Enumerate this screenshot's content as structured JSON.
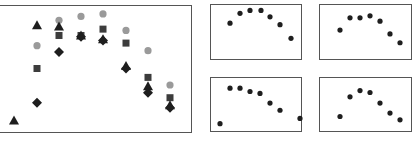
{
  "chart_data": [
    {
      "type": "scatter",
      "title": "",
      "xlabel": "",
      "ylabel": "",
      "grid": false,
      "legend": "none",
      "ylim": [
        0,
        100
      ],
      "x": [
        1,
        2,
        3,
        4,
        5,
        6,
        7,
        8
      ],
      "series": [
        {
          "name": "circle",
          "marker": "circle",
          "color": "#9a9a9a",
          "x": [
            2,
            3,
            4,
            5,
            6,
            7,
            8
          ],
          "values": [
            68,
            88,
            91,
            93,
            80,
            64,
            37
          ]
        },
        {
          "name": "square",
          "marker": "square",
          "color": "#3c3c3c",
          "x": [
            2,
            3,
            4,
            5,
            6,
            7,
            8
          ],
          "values": [
            50,
            76,
            76,
            81,
            70,
            43,
            27
          ]
        },
        {
          "name": "triangle",
          "marker": "triangle",
          "color": "#1e1e1e",
          "x": [
            1,
            2,
            3,
            4,
            5,
            6,
            7,
            8
          ],
          "values": [
            9,
            84,
            83,
            76,
            73,
            52,
            36,
            21
          ]
        },
        {
          "name": "diamond",
          "marker": "diamond",
          "color": "#1e1e1e",
          "x": [
            2,
            3,
            4,
            5,
            6,
            7,
            8
          ],
          "values": [
            23,
            63,
            75,
            72,
            50,
            31,
            19
          ]
        }
      ]
    },
    {
      "type": "scatter",
      "title": "",
      "xlabel": "",
      "ylabel": "",
      "grid": false,
      "ylim": [
        0,
        100
      ],
      "series": [
        {
          "name": "dots",
          "marker": "circle",
          "color": "#1e1e1e",
          "x": [
            1,
            2,
            3,
            4,
            5,
            6,
            7
          ],
          "values": [
            67,
            87,
            93,
            93,
            80,
            64,
            36
          ]
        }
      ]
    },
    {
      "type": "scatter",
      "title": "",
      "xlabel": "",
      "ylabel": "",
      "grid": false,
      "ylim": [
        0,
        100
      ],
      "series": [
        {
          "name": "dots",
          "marker": "circle",
          "color": "#1e1e1e",
          "x": [
            1,
            2,
            3,
            4,
            5,
            6,
            7
          ],
          "values": [
            53,
            78,
            78,
            82,
            71,
            45,
            27
          ]
        }
      ]
    },
    {
      "type": "scatter",
      "title": "",
      "xlabel": "",
      "ylabel": "",
      "grid": false,
      "ylim": [
        0,
        100
      ],
      "series": [
        {
          "name": "dots",
          "marker": "circle",
          "color": "#1e1e1e",
          "x": [
            1,
            2,
            3,
            4,
            5,
            6,
            7,
            8
          ],
          "values": [
            9,
            83,
            83,
            76,
            72,
            52,
            37,
            20
          ]
        }
      ]
    },
    {
      "type": "scatter",
      "title": "",
      "xlabel": "",
      "ylabel": "",
      "grid": false,
      "ylim": [
        0,
        100
      ],
      "series": [
        {
          "name": "dots",
          "marker": "circle",
          "color": "#1e1e1e",
          "x": [
            1,
            2,
            3,
            4,
            5,
            6,
            7
          ],
          "values": [
            24,
            65,
            78,
            74,
            52,
            31,
            17
          ]
        }
      ]
    }
  ],
  "layout": {
    "main_panel": {
      "left": 0,
      "top": 5,
      "right": 192,
      "bottom": 132,
      "x_positions": [
        14,
        37,
        59,
        81,
        103,
        126,
        148,
        170
      ]
    },
    "small_panels": [
      {
        "left": 210,
        "top": 4,
        "right": 301,
        "bottom": 59,
        "x_positions": [
          230,
          240,
          250,
          261,
          270,
          280,
          291
        ]
      },
      {
        "left": 319,
        "top": 4,
        "right": 411,
        "bottom": 59,
        "x_positions": [
          340,
          350,
          360,
          370,
          380,
          390,
          400
        ]
      },
      {
        "left": 210,
        "top": 77,
        "right": 301,
        "bottom": 131,
        "x_positions": [
          220,
          240,
          250,
          260,
          270,
          280,
          291,
          300
        ]
      },
      {
        "left": 319,
        "top": 77,
        "right": 411,
        "bottom": 131,
        "x_positions": [
          340,
          350,
          360,
          370,
          380,
          390,
          400
        ]
      }
    ]
  }
}
